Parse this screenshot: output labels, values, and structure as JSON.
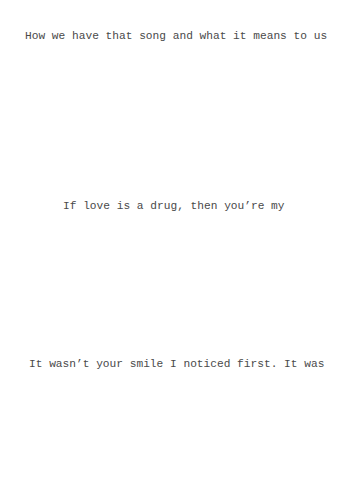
{
  "document": {
    "lines": [
      {
        "text": "How we have that song and what it means to us"
      },
      {
        "text": "If love is a drug, then you’re my"
      },
      {
        "text": "It wasn’t your smile I noticed first. It was"
      }
    ]
  }
}
